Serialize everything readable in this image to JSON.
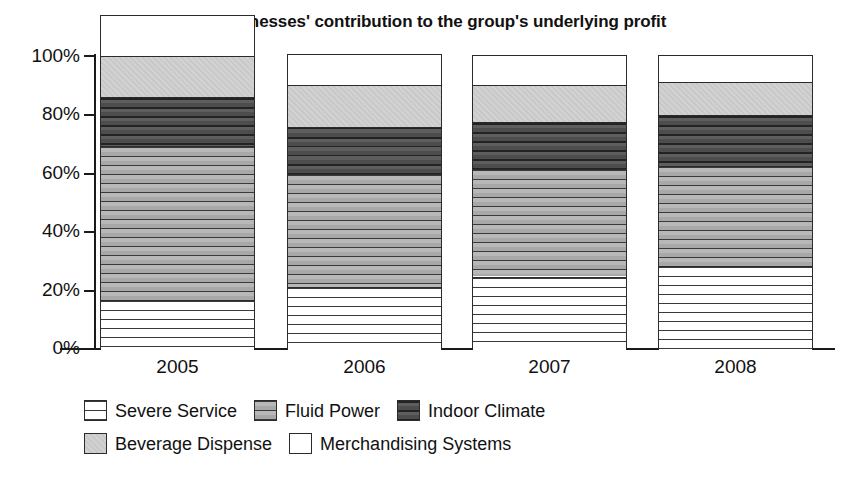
{
  "chart_data": {
    "type": "bar",
    "subtype": "stacked-percentage",
    "title": "The businesses' contribution to the group's underlying profit",
    "xlabel": "",
    "ylabel": "",
    "ylim": [
      0,
      100
    ],
    "ytick_labels": [
      "100%",
      "80%",
      "60%",
      "40%",
      "20%",
      "0%"
    ],
    "ytick_values": [
      100,
      80,
      60,
      40,
      20,
      0
    ],
    "grid": false,
    "legend_position": "bottom-left",
    "categories": [
      "2005",
      "2006",
      "2007",
      "2008"
    ],
    "series": [
      {
        "name": "Severe Service",
        "pattern": "white-horizontal-lines",
        "color": "#ffffff",
        "values": [
          17,
          21.5,
          25,
          28.5
        ]
      },
      {
        "name": "Fluid Power",
        "pattern": "grey-horizontal-lines",
        "color": "#b4b4b4",
        "values": [
          52.5,
          38.5,
          36.5,
          34
        ]
      },
      {
        "name": "Indoor Climate",
        "pattern": "dark-grey-horizontal-lines",
        "color": "#565656",
        "values": [
          16.5,
          16,
          16,
          17.5
        ]
      },
      {
        "name": "Beverage Dispense",
        "pattern": "light-grey-solid",
        "color": "#cccccc",
        "values": [
          14,
          14,
          12.5,
          11
        ]
      },
      {
        "name": "Merchandising Systems",
        "pattern": "white-solid",
        "color": "#ffffff",
        "values": [
          13.5,
          10.5,
          10,
          9
        ]
      }
    ]
  },
  "legend": {
    "row1": [
      "Severe Service",
      "Fluid Power",
      "Indoor Climate"
    ],
    "row2": [
      "Beverage Dispense",
      "Merchandising Systems"
    ]
  }
}
